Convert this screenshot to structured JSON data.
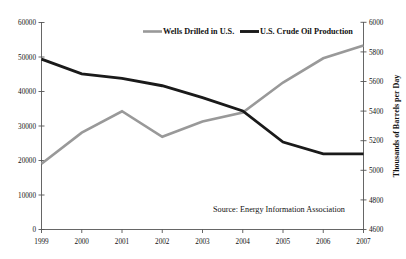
{
  "chart_data": {
    "type": "line",
    "title": "",
    "xlabel": "",
    "ylabel": "",
    "categories": [
      "1999",
      "2000",
      "2001",
      "2002",
      "2003",
      "2004",
      "2005",
      "2006",
      "2007"
    ],
    "x": [
      1999,
      2000,
      2001,
      2002,
      2003,
      2004,
      2005,
      2006,
      2007
    ],
    "series": [
      {
        "name": "Wells Drilled in U.S.",
        "axis": "left",
        "color": "#999999",
        "values": [
          19000,
          28000,
          34200,
          26800,
          31200,
          33800,
          42500,
          49500,
          53200
        ]
      },
      {
        "name": "U.S. Crude Oil Production",
        "axis": "right",
        "color": "#1a1a1a",
        "values": [
          5750,
          5650,
          5620,
          5570,
          5490,
          5400,
          5190,
          5110,
          5110
        ]
      }
    ],
    "left_axis": {
      "label": "",
      "ylim": [
        0,
        60000
      ],
      "ticks": [
        0,
        10000,
        20000,
        30000,
        40000,
        50000,
        60000
      ],
      "tick_labels": [
        "0",
        "10000",
        "20000",
        "30000",
        "40000",
        "50000",
        "60000"
      ]
    },
    "right_axis": {
      "label": "Thousands of Barrels per Day",
      "ylim": [
        4600,
        6000
      ],
      "ticks": [
        4600,
        4800,
        5000,
        5200,
        5400,
        5600,
        5800,
        6000
      ],
      "tick_labels": [
        "4600",
        "4800",
        "5000",
        "5200",
        "5400",
        "5600",
        "5800",
        "6000"
      ]
    },
    "grid": false,
    "legend": {
      "position": "top-center",
      "entries": [
        {
          "label": "Wells Drilled in U.S.",
          "color": "#999999"
        },
        {
          "label": "U.S. Crude Oil Production",
          "color": "#1a1a1a"
        }
      ]
    },
    "annotations": [
      {
        "text": "Source: Energy Information Association",
        "position": "bottom-right-inside"
      }
    ]
  }
}
